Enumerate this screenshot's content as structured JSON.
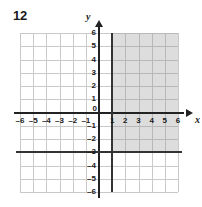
{
  "problem": {
    "number": "12"
  },
  "chart_data": {
    "type": "scatter",
    "title": "",
    "xlabel": "x",
    "ylabel": "y",
    "xlim": [
      -6,
      6
    ],
    "ylim": [
      -6,
      6
    ],
    "grid": true,
    "legend": false,
    "x_ticks": [
      "-6",
      "-5",
      "-4",
      "-3",
      "-2",
      "-1",
      "0",
      "1",
      "2",
      "3",
      "4",
      "5",
      "6"
    ],
    "y_ticks": [
      "6",
      "5",
      "4",
      "3",
      "2",
      "1",
      "0",
      "-1",
      "-2",
      "-3",
      "-4",
      "-5",
      "-6"
    ],
    "origin_label": "0",
    "boundaries": [
      {
        "name": "vertical-boundary",
        "type": "vertical",
        "value": 1,
        "style": "solid",
        "color": "#333333"
      },
      {
        "name": "horizontal-boundary",
        "type": "horizontal",
        "value": -3,
        "style": "solid",
        "color": "#333333"
      }
    ],
    "shaded_region": {
      "name": "solution-region",
      "x_min": 1,
      "x_max": 6,
      "y_min": -3,
      "y_max": 6,
      "color": "#969696",
      "opacity": 0.32
    },
    "annotations": []
  }
}
